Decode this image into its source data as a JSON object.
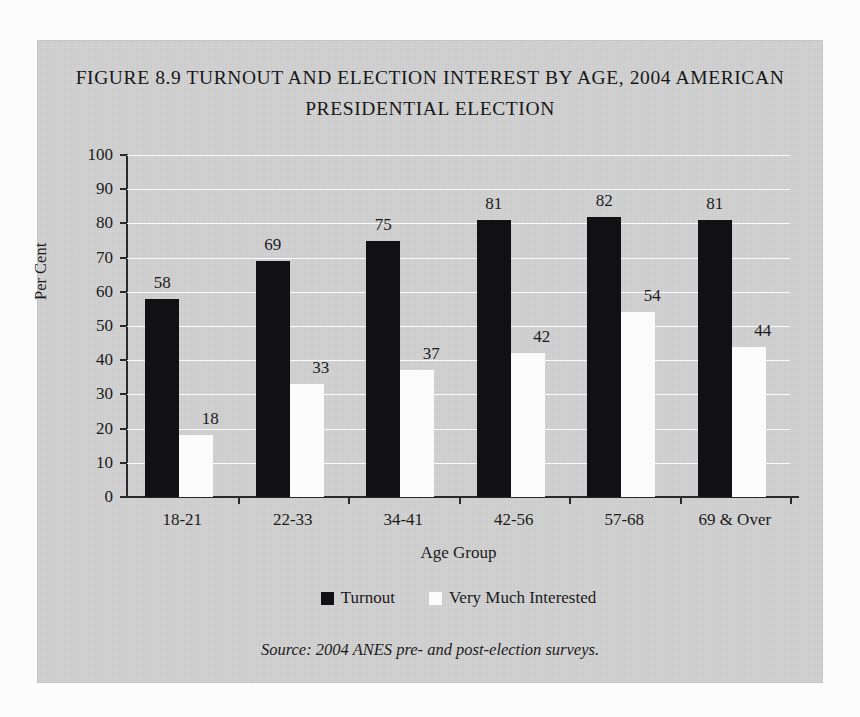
{
  "figure": {
    "title_line1": "FIGURE 8.9 TURNOUT AND ELECTION INTEREST BY AGE, 2004 AMERICAN",
    "title_line2": "PRESIDENTIAL ELECTION",
    "source": "Source: 2004 ANES pre- and post-election surveys."
  },
  "colors": {
    "panel_background": "#d2d2d2",
    "turnout_bar": "#111113",
    "interest_bar": "#fbfbfb",
    "axis": "#2a2a2c",
    "gridline": "#fafafa",
    "text": "#1b1b1d"
  },
  "chart_data": {
    "type": "bar",
    "title": "FIGURE 8.9 TURNOUT AND ELECTION INTEREST BY AGE, 2004 AMERICAN PRESIDENTIAL ELECTION",
    "xlabel": "Age Group",
    "ylabel": "Per Cent",
    "ylim": [
      0,
      100
    ],
    "ytick_step": 10,
    "yticks": [
      0,
      10,
      20,
      30,
      40,
      50,
      60,
      70,
      80,
      90,
      100
    ],
    "ytick_labels": [
      "0",
      "10",
      "20",
      "30",
      "40",
      "50",
      "60",
      "70",
      "80",
      "90",
      "100"
    ],
    "categories": [
      "18-21",
      "22-33",
      "34-41",
      "42-56",
      "57-68",
      "69 & Over"
    ],
    "series": [
      {
        "name": "Turnout",
        "color": "#111113",
        "values": [
          58,
          69,
          75,
          81,
          82,
          81
        ]
      },
      {
        "name": "Very Much Interested",
        "color": "#fbfbfb",
        "values": [
          18,
          33,
          37,
          42,
          54,
          44
        ]
      }
    ],
    "data_labels": true,
    "grid": true,
    "grid_axis": "y",
    "legend_position": "bottom",
    "annotation": "Source: 2004 ANES pre- and post-election surveys."
  }
}
